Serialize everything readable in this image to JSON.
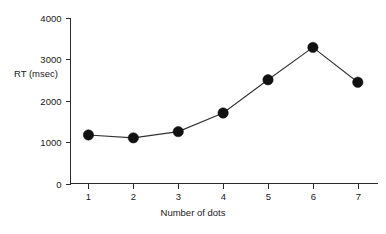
{
  "chart_data": {
    "type": "line",
    "title": "",
    "subtitle": "",
    "xlabel": "Number of dots",
    "ylabel": "RT (msec)",
    "x": [
      1,
      2,
      3,
      4,
      5,
      6,
      7
    ],
    "categories": [
      "1",
      "2",
      "3",
      "4",
      "5",
      "6",
      "7"
    ],
    "values": [
      1170,
      1100,
      1250,
      1700,
      2500,
      3280,
      2440
    ],
    "series": [
      {
        "name": "RT",
        "values": [
          1170,
          1100,
          1250,
          1700,
          2500,
          3280,
          2440
        ]
      }
    ],
    "xlim": [
      0.6,
      7.45
    ],
    "ylim": [
      0,
      4000
    ],
    "xticks": [
      1,
      2,
      3,
      4,
      5,
      6,
      7
    ],
    "xtick_labels": [
      "1",
      "2",
      "3",
      "4",
      "5",
      "6",
      "7"
    ],
    "yticks": [
      0,
      1000,
      2000,
      3000,
      4000
    ],
    "ytick_labels": [
      "0",
      "1000",
      "2000",
      "3000",
      "4000"
    ],
    "grid": false,
    "legend": false,
    "legend_position": "none",
    "marker": "filled-circle",
    "line_color": "#333333",
    "marker_color": "#111111",
    "axis_color": "#2b2b2b",
    "background_color": "#ffffff",
    "annotations": []
  }
}
